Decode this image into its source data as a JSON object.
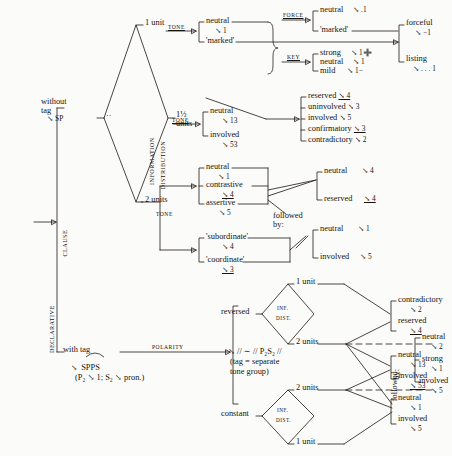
{
  "diagram": {
    "ink_color": "#2a2520",
    "paper_color": "#fbfbfa",
    "entry": {
      "system_label": "DECLARATIVE",
      "clause_label": "CLAUSE"
    },
    "tag": {
      "without": {
        "line1": "without",
        "line2": "tag",
        "realization": "↘ SP"
      },
      "with": {
        "label": "with tag",
        "realization": "SPPS",
        "realization_detail": "(P₂ ↘ 1; S₂ ↘ pron.)",
        "system": "POLARITY"
      }
    },
    "inf_dist": {
      "system_line1": "INFORMATION",
      "system_line2": "DISTRIBUTION",
      "dots": "··",
      "options": [
        "1 unit",
        "1½ units",
        "2 units"
      ],
      "one_half_line1": "1½",
      "one_half_line2": "units"
    },
    "tone_system": "TONE",
    "force_system": "FORCE",
    "key_system": "KEY",
    "branch_one_unit": {
      "system": "TONE",
      "options": [
        {
          "label": "neutral",
          "tone": "↘ 1"
        },
        {
          "label": "'marked'",
          "tone": ""
        }
      ]
    },
    "force": {
      "system": "FORCE",
      "options": [
        {
          "label": "neutral",
          "tone": "↘ .1"
        },
        {
          "label": "'marked'",
          "tone": ""
        }
      ]
    },
    "key": {
      "system": "KEY",
      "options": [
        {
          "label": "strong",
          "tone": "↘ 1➕"
        },
        {
          "label": "neutral",
          "tone": "↘ 1"
        },
        {
          "label": "mild",
          "tone": "↘ 1−"
        }
      ]
    },
    "marked_outcome": {
      "options": [
        {
          "label": "forceful",
          "tone": "↘ −1"
        },
        {
          "label": "listing",
          "tone": "↘ . . . 1"
        }
      ]
    },
    "branch_one_half": {
      "system": "TONE",
      "options": [
        {
          "label": "neutral",
          "tone": "↘ 13"
        },
        {
          "label": "involved",
          "tone": "↘ 53"
        }
      ]
    },
    "one_unit_marked_outcomes": [
      {
        "label": "reserved",
        "tone": "↘ 4",
        "underline": true
      },
      {
        "label": "uninvolved",
        "tone": "↘ 3",
        "underline": false
      },
      {
        "label": "involved",
        "tone": "↘ 5",
        "underline": false
      },
      {
        "label": "confirmatory",
        "tone": "↘ 3",
        "underline": true
      },
      {
        "label": "contradictory",
        "tone": "↘ 2",
        "underline": false
      }
    ],
    "branch_two_units": {
      "system": "TONE",
      "group_a": [
        {
          "label": "neutral",
          "tone": "↘ 1"
        },
        {
          "label": "contrastive",
          "tone": "↘ 4",
          "underline": true
        },
        {
          "label": "assertive",
          "tone": "↘ 5"
        }
      ],
      "group_b": [
        {
          "label": "'subordinate'",
          "tone": "↘ 4"
        },
        {
          "label": "'coordinate'",
          "tone": "↘ 3",
          "underline": true
        }
      ],
      "followed_by": "followed\nby:",
      "followed_by_line1": "followed",
      "followed_by_line2": "by:",
      "outcome_a": [
        {
          "label": "neutral",
          "tone": "↘ 4"
        },
        {
          "label": "reserved",
          "tone": "↘ 4",
          "underline": true
        }
      ],
      "outcome_b": [
        {
          "label": "neutral",
          "tone": "↘ 1"
        },
        {
          "label": "involved",
          "tone": "↘ 5"
        }
      ]
    },
    "polarity": {
      "system": "POLARITY",
      "options": [
        "reversed",
        "constant"
      ],
      "reversed_label": "reversed",
      "constant_label": "constant"
    },
    "inf_dist_small": {
      "line1": "INF.",
      "line2": "DIST."
    },
    "reversed_branch": {
      "options": [
        "1 unit",
        "2 units"
      ],
      "two_units_realization": "↘ // ∼ // P₂S₂ //",
      "two_units_note_line1": "(tag = separate",
      "two_units_note_line2": "tone group)"
    },
    "constant_branch": {
      "options": [
        "2 units",
        "1 unit"
      ]
    },
    "bottom_outcomes": {
      "group1": [
        {
          "label": "contradictory",
          "tone": "↘ 2"
        },
        {
          "label": "reserved",
          "tone": "↘ 4",
          "underline": true
        }
      ],
      "group2": [
        {
          "label": "neutral",
          "tone": "↘ 13"
        },
        {
          "label": "involved",
          "tone": "↘ 53",
          "underline": true
        }
      ],
      "group3": [
        {
          "label": "neutral",
          "tone": "↘ 1"
        },
        {
          "label": "involved",
          "tone": "↘ 5"
        }
      ]
    },
    "bottom_followed_by": {
      "line1": "followed",
      "line2": "by:",
      "options": [
        {
          "label": "neutral",
          "tone": "↘ 2"
        },
        {
          "label": "strong",
          "tone": "↘ 1"
        },
        {
          "label": "involved",
          "tone": "↘ 5"
        }
      ]
    }
  }
}
